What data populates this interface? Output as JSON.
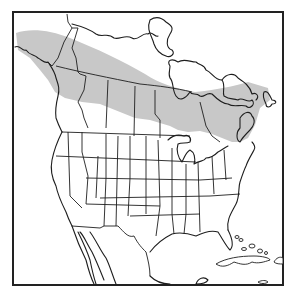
{
  "map": {
    "type": "range-map",
    "region": "North America",
    "colors": {
      "background": "#ffffff",
      "range_fill": "#c8c8c8",
      "outline": "#1e1e1e",
      "frame": "#222222"
    },
    "range": {
      "label": "Shaded range",
      "extent": "Boreal band from Alaska across Canada to the Maritimes and northern New England"
    },
    "frame": {
      "x": 13,
      "y": 12,
      "width": 270,
      "height": 273
    }
  }
}
